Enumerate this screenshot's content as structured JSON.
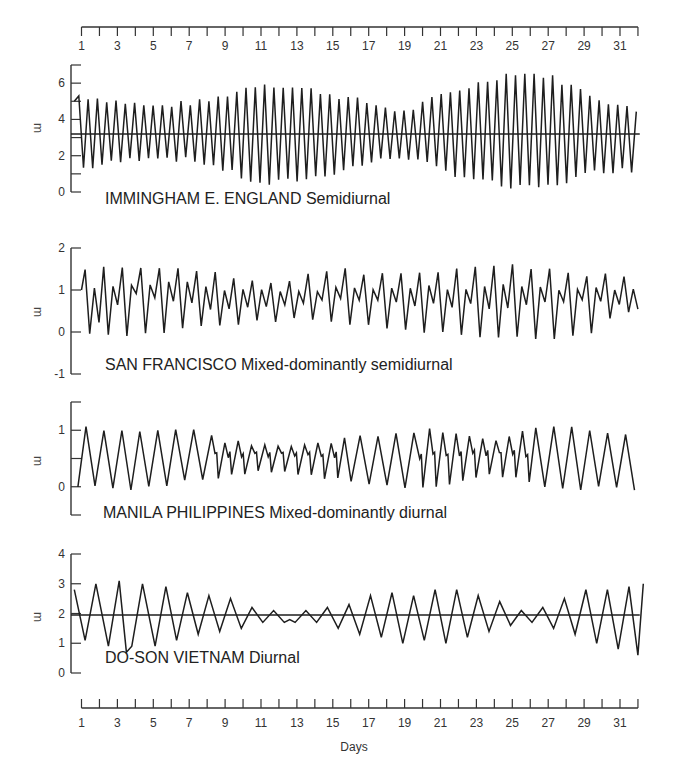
{
  "x_axis": {
    "label": "Days",
    "day_min": 1,
    "day_max": 32,
    "tick_labels": [
      "1",
      "3",
      "5",
      "7",
      "9",
      "11",
      "13",
      "15",
      "17",
      "19",
      "21",
      "23",
      "25",
      "27",
      "29",
      "31"
    ],
    "tick_label_days": [
      1,
      3,
      5,
      7,
      9,
      11,
      13,
      15,
      17,
      19,
      21,
      23,
      25,
      27,
      29,
      31
    ]
  },
  "chart_data": {
    "type": "line",
    "xlabel": "Days",
    "ylabel": "m",
    "x_range": [
      1,
      32
    ],
    "x_ticks": [
      1,
      2,
      3,
      4,
      5,
      6,
      7,
      8,
      9,
      10,
      11,
      12,
      13,
      14,
      15,
      16,
      17,
      18,
      19,
      20,
      21,
      22,
      23,
      24,
      25,
      26,
      27,
      28,
      29,
      30,
      31,
      32
    ],
    "x_tick_labels": [
      "1",
      "3",
      "5",
      "7",
      "9",
      "11",
      "13",
      "15",
      "17",
      "19",
      "21",
      "23",
      "25",
      "27",
      "29",
      "31"
    ],
    "grid": false,
    "panels": [
      {
        "name": "IMMINGHAM  E. ENGLAND Semidiurnal",
        "station": "IMMINGHAM  E. ENGLAND",
        "tide_type": "Semidiurnal",
        "ylabel": "m",
        "ylim": [
          0,
          7
        ],
        "y_ticks": [
          0,
          1,
          2,
          3,
          4,
          5,
          6,
          7
        ],
        "y_tick_labels": [
          "0",
          "2",
          "4",
          "6"
        ],
        "y_tick_label_values": [
          0,
          2,
          4,
          6
        ],
        "mean_line": 3.2,
        "extremes": [
          [
            0.6,
            5.0
          ],
          [
            1.1,
            1.3
          ],
          [
            1.6,
            5.3
          ],
          [
            2.0,
            1.4
          ],
          [
            2.3,
            5.3
          ],
          [
            2.8,
            1.8
          ],
          [
            3.3,
            4.8
          ],
          [
            3.8,
            1.8
          ],
          [
            4.2,
            4.7
          ],
          [
            4.7,
            2.0
          ],
          [
            5.2,
            4.8
          ],
          [
            5.6,
            1.8
          ],
          [
            6.0,
            4.9
          ],
          [
            6.5,
            2.0
          ],
          [
            7.0,
            4.8
          ],
          [
            7.4,
            1.3
          ],
          [
            7.8,
            4.9
          ],
          [
            8.3,
            1.6
          ],
          [
            8.8,
            5.3
          ],
          [
            9.3,
            0.9
          ],
          [
            9.7,
            5.3
          ],
          [
            10.1,
            1.4
          ],
          [
            10.6,
            5.6
          ],
          [
            11.0,
            0.6
          ],
          [
            11.5,
            5.7
          ],
          [
            12.0,
            1.0
          ],
          [
            12.4,
            5.8
          ],
          [
            12.9,
            0.5
          ],
          [
            13.4,
            5.4
          ],
          [
            13.9,
            0.8
          ],
          [
            14.3,
            5.9
          ],
          [
            14.8,
            0.4
          ],
          [
            15.3,
            5.5
          ],
          [
            15.7,
            0.8
          ],
          [
            16.2,
            6.0
          ],
          [
            16.6,
            0.6
          ],
          [
            17.1,
            5.6
          ],
          [
            17.5,
            0.4
          ],
          [
            17.9,
            6.0
          ],
          [
            18.3,
            0.8
          ],
          [
            18.8,
            5.6
          ],
          [
            19.3,
            0.8
          ],
          [
            19.7,
            6.0
          ],
          [
            20.2,
            0.8
          ],
          [
            20.7,
            5.6
          ],
          [
            21.1,
            0.6
          ],
          [
            21.6,
            5.9
          ],
          [
            22.1,
            1.0
          ],
          [
            22.6,
            5.5
          ],
          [
            23.0,
            1.1
          ],
          [
            23.5,
            5.3
          ],
          [
            24.0,
            1.2
          ],
          [
            24.4,
            5.5
          ],
          [
            24.9,
            1.1
          ],
          [
            25.4,
            5.3
          ],
          [
            25.9,
            1.3
          ],
          [
            26.2,
            5.1
          ],
          [
            26.5,
            4.8
          ]
        ],
        "extremes_note": "approximate high/low water levels read from the curve; envelope: neap ~day 2-8 and 17-20, spring ~day 10-13 and 24-27",
        "envelope_points": [
          {
            "day": 1,
            "high": 5.3,
            "low": 1.3
          },
          {
            "day": 5,
            "high": 4.7,
            "low": 2.0
          },
          {
            "day": 8,
            "high": 5.0,
            "low": 1.6
          },
          {
            "day": 11,
            "high": 6.0,
            "low": 0.4
          },
          {
            "day": 14,
            "high": 5.6,
            "low": 0.8
          },
          {
            "day": 17,
            "high": 4.9,
            "low": 1.6
          },
          {
            "day": 19,
            "high": 4.4,
            "low": 2.0
          },
          {
            "day": 21,
            "high": 5.3,
            "low": 1.2
          },
          {
            "day": 25,
            "high": 6.6,
            "low": 0.2
          },
          {
            "day": 27,
            "high": 6.4,
            "low": 0.3
          },
          {
            "day": 30,
            "high": 5.1,
            "low": 1.2
          },
          {
            "day": 32,
            "high": 4.4,
            "low": 1.2
          }
        ]
      },
      {
        "name": "SAN FRANCISCO  Mixed-dominantly semidiurnal",
        "station": "SAN FRANCISCO",
        "tide_type": "Mixed-dominantly semidiurnal",
        "ylabel": "m",
        "ylim": [
          -1,
          2
        ],
        "y_ticks": [
          -1,
          0,
          1,
          2
        ],
        "y_tick_labels": [
          "-1",
          "0",
          "1",
          "2"
        ],
        "y_tick_label_values": [
          -1,
          0,
          1,
          2
        ],
        "mean_line": null,
        "envelope_points": [
          {
            "day": 1,
            "higher_high": 1.55,
            "lower_high": 1.0,
            "higher_low": 0.0,
            "lower_low": 0.0
          },
          {
            "day": 4,
            "higher_high": 1.6,
            "lower_high": 1.2,
            "higher_low": 0.9,
            "lower_low": -0.05
          },
          {
            "day": 8,
            "higher_high": 1.4,
            "lower_high": 1.1,
            "higher_low": 0.6,
            "lower_low": 0.2
          },
          {
            "day": 12,
            "higher_high": 1.15,
            "lower_high": 0.9,
            "higher_low": 0.6,
            "lower_low": 0.3
          },
          {
            "day": 15,
            "higher_high": 1.45,
            "lower_high": 1.0,
            "higher_low": 0.8,
            "lower_low": 0.2
          },
          {
            "day": 19,
            "higher_high": 1.4,
            "lower_high": 1.0,
            "higher_low": 0.7,
            "lower_low": 0.0
          },
          {
            "day": 23,
            "higher_high": 1.55,
            "lower_high": 1.1,
            "higher_low": 0.6,
            "lower_low": -0.05
          },
          {
            "day": 26,
            "higher_high": 1.55,
            "lower_high": 1.1,
            "higher_low": 0.6,
            "lower_low": -0.15
          },
          {
            "day": 29,
            "higher_high": 1.4,
            "lower_high": 1.0,
            "higher_low": 0.8,
            "lower_low": -0.05
          },
          {
            "day": 32,
            "higher_high": 1.35,
            "lower_high": 1.1,
            "higher_low": 0.6,
            "lower_low": 0.6
          }
        ]
      },
      {
        "name": "MANILA PHILIPPINES  Mixed-dominantly diurnal",
        "station": "MANILA PHILIPPINES",
        "tide_type": "Mixed-dominantly diurnal",
        "ylabel": "m",
        "ylim": [
          -0.5,
          1.5
        ],
        "y_ticks": [
          -0.5,
          0,
          0.5,
          1,
          1.5
        ],
        "y_tick_labels": [
          "0",
          "1"
        ],
        "y_tick_label_values": [
          0,
          1
        ],
        "mean_line": null,
        "envelope_points": [
          {
            "day": 1,
            "high": 1.05,
            "low": 0.0
          },
          {
            "day": 4,
            "high": 1.0,
            "low": -0.05
          },
          {
            "day": 7,
            "high": 1.0,
            "low": 0.1
          },
          {
            "day": 9,
            "high": 0.8,
            "low": 0.2
          },
          {
            "day": 12,
            "high": 0.7,
            "low": 0.3
          },
          {
            "day": 15,
            "high": 0.8,
            "low": 0.15
          },
          {
            "day": 18,
            "high": 0.95,
            "low": 0.0
          },
          {
            "day": 21,
            "high": 1.0,
            "low": 0.0
          },
          {
            "day": 24,
            "high": 0.85,
            "low": 0.25
          },
          {
            "day": 27,
            "high": 1.05,
            "low": -0.05
          },
          {
            "day": 30,
            "high": 1.0,
            "low": 0.0
          },
          {
            "day": 32,
            "high": 0.9,
            "low": -0.05
          }
        ]
      },
      {
        "name": "DO-SON VIETNAM  Diurnal",
        "station": "DO-SON VIETNAM",
        "tide_type": "Diurnal",
        "ylabel": "m",
        "ylim": [
          0,
          4
        ],
        "y_ticks": [
          0,
          1,
          2,
          3,
          4
        ],
        "y_tick_labels": [
          "0",
          "1",
          "2",
          "3",
          "4"
        ],
        "y_tick_label_values": [
          0,
          1,
          2,
          3,
          4
        ],
        "mean_line": 1.95,
        "extremes": [
          [
            0.6,
            2.8
          ],
          [
            1.2,
            1.1
          ],
          [
            1.8,
            3.0
          ],
          [
            2.5,
            0.9
          ],
          [
            3.1,
            3.1
          ],
          [
            3.5,
            0.7
          ],
          [
            3.8,
            0.9
          ],
          [
            4.4,
            3.0
          ],
          [
            5.1,
            0.9
          ],
          [
            5.7,
            2.9
          ],
          [
            6.3,
            1.1
          ],
          [
            6.9,
            2.7
          ],
          [
            7.5,
            1.3
          ],
          [
            8.1,
            2.6
          ],
          [
            8.7,
            1.4
          ],
          [
            9.3,
            2.5
          ],
          [
            9.9,
            1.5
          ],
          [
            10.5,
            2.2
          ],
          [
            11.1,
            1.7
          ],
          [
            11.7,
            2.1
          ],
          [
            12.3,
            1.7
          ],
          [
            12.6,
            1.8
          ],
          [
            12.9,
            1.7
          ],
          [
            13.5,
            2.1
          ],
          [
            14.1,
            1.7
          ],
          [
            14.7,
            2.2
          ],
          [
            15.3,
            1.5
          ],
          [
            15.9,
            2.3
          ],
          [
            16.5,
            1.3
          ],
          [
            17.1,
            2.6
          ],
          [
            17.7,
            1.2
          ],
          [
            18.3,
            2.7
          ],
          [
            18.9,
            1.0
          ],
          [
            19.5,
            2.6
          ],
          [
            20.1,
            1.1
          ],
          [
            20.7,
            2.8
          ],
          [
            21.3,
            1.0
          ],
          [
            21.9,
            2.8
          ],
          [
            22.5,
            1.2
          ],
          [
            23.1,
            2.6
          ],
          [
            23.7,
            1.4
          ],
          [
            24.3,
            2.4
          ],
          [
            24.9,
            1.6
          ],
          [
            25.5,
            2.1
          ],
          [
            26.1,
            1.7
          ],
          [
            26.7,
            2.2
          ],
          [
            27.3,
            1.5
          ],
          [
            27.9,
            2.5
          ],
          [
            28.5,
            1.3
          ],
          [
            29.1,
            2.8
          ],
          [
            29.7,
            1.0
          ],
          [
            30.3,
            2.8
          ],
          [
            30.9,
            0.8
          ],
          [
            31.5,
            2.9
          ],
          [
            32.0,
            0.6
          ],
          [
            32.3,
            3.0
          ]
        ],
        "envelope_points": [
          {
            "day": 1,
            "high": 3.0,
            "low": 1.0
          },
          {
            "day": 4,
            "high": 3.1,
            "low": 0.7
          },
          {
            "day": 7,
            "high": 2.7,
            "low": 1.2
          },
          {
            "day": 10,
            "high": 2.2,
            "low": 1.6
          },
          {
            "day": 12,
            "high": 2.05,
            "low": 1.7
          },
          {
            "day": 15,
            "high": 2.3,
            "low": 1.4
          },
          {
            "day": 19,
            "high": 2.7,
            "low": 1.0
          },
          {
            "day": 21,
            "high": 2.8,
            "low": 1.0
          },
          {
            "day": 24,
            "high": 2.4,
            "low": 1.5
          },
          {
            "day": 26,
            "high": 2.1,
            "low": 1.6
          },
          {
            "day": 29,
            "high": 2.8,
            "low": 1.1
          },
          {
            "day": 31,
            "high": 3.0,
            "low": 0.6
          }
        ]
      }
    ]
  },
  "panels_display": [
    {
      "title": "IMMINGHAM  E. ENGLAND Semidiurnal",
      "y_unit": "m"
    },
    {
      "title": "SAN FRANCISCO  Mixed-dominantly semidiurnal",
      "y_unit": "m"
    },
    {
      "title": "MANILA PHILIPPINES  Mixed-dominantly diurnal",
      "y_unit": "m"
    },
    {
      "title": "DO-SON VIETNAM  Diurnal",
      "y_unit": "m"
    }
  ]
}
